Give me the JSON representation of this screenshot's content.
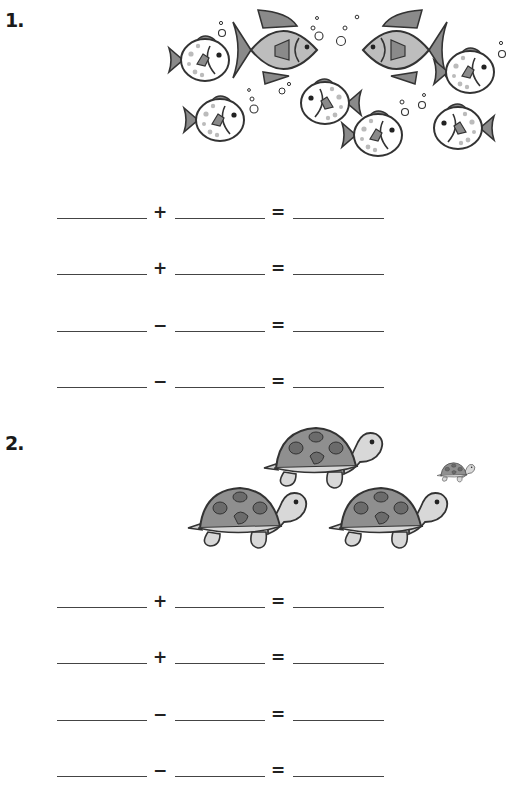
{
  "worksheet": {
    "problems": [
      {
        "number": "1.",
        "illustration": "fish",
        "illustration_content": {
          "large_grey_fish": 2,
          "spotted_puffer_fish": 6
        },
        "equations": [
          {
            "op": "+",
            "eq": "="
          },
          {
            "op": "+",
            "eq": "="
          },
          {
            "op": "−",
            "eq": "="
          },
          {
            "op": "−",
            "eq": "="
          }
        ]
      },
      {
        "number": "2.",
        "illustration": "turtles",
        "illustration_content": {
          "large_turtles": 3,
          "small_turtles": 1
        },
        "equations": [
          {
            "op": "+",
            "eq": "="
          },
          {
            "op": "+",
            "eq": "="
          },
          {
            "op": "−",
            "eq": "="
          },
          {
            "op": "−",
            "eq": "="
          }
        ]
      }
    ]
  },
  "colors": {
    "fish_body": "#bdbdbd",
    "fin": "#8a8a8a",
    "outline": "#333333",
    "shell": "#8f8f8f",
    "shell_spot": "#6b6b6b",
    "skin": "#d8d8d8"
  }
}
